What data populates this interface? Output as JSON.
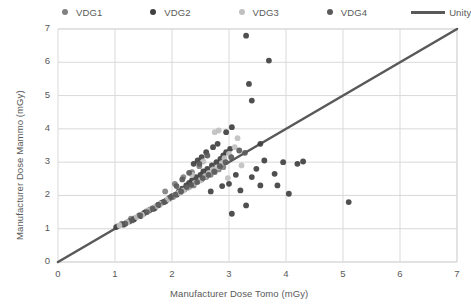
{
  "chart_data": {
    "type": "scatter",
    "title": "",
    "xlabel": "Manufacturer Dose Tomo (mGy)",
    "ylabel": "Manufacturer Dose Mammo (mGy)",
    "xlim": [
      0,
      7
    ],
    "ylim": [
      0,
      7
    ],
    "xticks": [
      0,
      1,
      2,
      3,
      4,
      5,
      6,
      7
    ],
    "yticks": [
      0,
      1,
      2,
      3,
      4,
      5,
      6,
      7
    ],
    "grid": true,
    "legend_position": "top",
    "colors": {
      "VDG1": "#808080",
      "VDG2": "#404040",
      "VDG3": "#c0c0c0",
      "VDG4": "#5a5a5a",
      "Unity": "#595959",
      "grid": "#d9d9d9",
      "axis": "#d9d9d9",
      "text": "#595959"
    },
    "series": [
      {
        "name": "VDG1",
        "color": "#808080",
        "points": [
          [
            1.05,
            1.08
          ],
          [
            1.12,
            1.15
          ],
          [
            1.2,
            1.18
          ],
          [
            1.28,
            1.3
          ],
          [
            1.35,
            1.32
          ],
          [
            1.42,
            1.4
          ],
          [
            1.5,
            1.45
          ],
          [
            1.55,
            1.52
          ],
          [
            1.62,
            1.58
          ],
          [
            1.7,
            1.62
          ],
          [
            1.78,
            1.72
          ],
          [
            1.85,
            1.8
          ],
          [
            1.9,
            1.85
          ],
          [
            1.95,
            1.9
          ],
          [
            2.02,
            1.95
          ],
          [
            2.1,
            2.05
          ],
          [
            2.15,
            2.1
          ],
          [
            2.22,
            2.18
          ],
          [
            2.3,
            2.25
          ],
          [
            2.38,
            2.3
          ],
          [
            2.45,
            2.42
          ],
          [
            2.52,
            2.48
          ],
          [
            2.6,
            2.55
          ],
          [
            2.68,
            2.62
          ],
          [
            2.75,
            2.7
          ],
          [
            2.82,
            2.78
          ],
          [
            2.9,
            2.85
          ],
          [
            2.2,
            2.55
          ],
          [
            2.35,
            2.7
          ],
          [
            2.48,
            2.88
          ],
          [
            2.05,
            2.35
          ],
          [
            1.88,
            2.12
          ]
        ]
      },
      {
        "name": "VDG2",
        "color": "#404040",
        "points": [
          [
            1.02,
            1.05
          ],
          [
            1.15,
            1.12
          ],
          [
            1.25,
            1.22
          ],
          [
            1.33,
            1.28
          ],
          [
            1.45,
            1.38
          ],
          [
            1.52,
            1.48
          ],
          [
            1.6,
            1.55
          ],
          [
            1.68,
            1.6
          ],
          [
            1.75,
            1.7
          ],
          [
            1.82,
            1.78
          ],
          [
            1.88,
            1.82
          ],
          [
            1.95,
            1.92
          ],
          [
            2.0,
            1.98
          ],
          [
            2.08,
            2.02
          ],
          [
            2.12,
            2.12
          ],
          [
            2.18,
            2.2
          ],
          [
            2.25,
            2.3
          ],
          [
            2.3,
            2.38
          ],
          [
            2.35,
            2.45
          ],
          [
            2.42,
            2.55
          ],
          [
            2.5,
            2.62
          ],
          [
            2.55,
            2.72
          ],
          [
            2.62,
            2.8
          ],
          [
            2.7,
            2.9
          ],
          [
            2.78,
            3.0
          ],
          [
            2.85,
            3.1
          ],
          [
            2.9,
            3.2
          ],
          [
            2.95,
            3.3
          ],
          [
            3.02,
            3.4
          ],
          [
            2.6,
            3.3
          ],
          [
            2.72,
            3.45
          ],
          [
            2.8,
            3.55
          ],
          [
            2.52,
            3.15
          ],
          [
            2.45,
            3.05
          ],
          [
            2.38,
            2.95
          ],
          [
            3.3,
            6.8
          ],
          [
            3.7,
            6.05
          ],
          [
            3.35,
            5.35
          ],
          [
            3.4,
            4.85
          ],
          [
            2.95,
            3.9
          ],
          [
            3.05,
            4.05
          ],
          [
            3.55,
            3.55
          ],
          [
            3.62,
            3.05
          ],
          [
            3.2,
            2.15
          ],
          [
            3.55,
            2.3
          ],
          [
            3.8,
            2.65
          ],
          [
            3.85,
            2.3
          ],
          [
            4.05,
            2.05
          ],
          [
            3.3,
            1.7
          ],
          [
            3.05,
            1.45
          ],
          [
            5.1,
            1.8
          ],
          [
            4.3,
            3.02
          ],
          [
            4.2,
            2.95
          ],
          [
            3.95,
            3.0
          ],
          [
            3.12,
            2.62
          ],
          [
            3.4,
            2.55
          ],
          [
            2.88,
            2.28
          ],
          [
            3.0,
            2.35
          ],
          [
            2.68,
            2.12
          ],
          [
            3.48,
            2.8
          ]
        ]
      },
      {
        "name": "VDG3",
        "color": "#c0c0c0",
        "points": [
          [
            1.08,
            1.1
          ],
          [
            1.22,
            1.2
          ],
          [
            1.38,
            1.35
          ],
          [
            1.48,
            1.42
          ],
          [
            1.58,
            1.55
          ],
          [
            1.65,
            1.62
          ],
          [
            1.72,
            1.68
          ],
          [
            1.8,
            1.75
          ],
          [
            1.92,
            1.88
          ],
          [
            2.05,
            2.0
          ],
          [
            2.12,
            2.08
          ],
          [
            2.2,
            2.15
          ],
          [
            2.28,
            2.22
          ],
          [
            2.4,
            2.38
          ],
          [
            2.5,
            2.45
          ],
          [
            2.58,
            2.58
          ],
          [
            2.65,
            2.68
          ],
          [
            2.72,
            2.78
          ],
          [
            2.8,
            2.85
          ],
          [
            2.88,
            2.98
          ],
          [
            2.92,
            3.12
          ],
          [
            3.0,
            3.25
          ],
          [
            3.1,
            3.45
          ],
          [
            2.75,
            3.9
          ],
          [
            2.82,
            3.95
          ],
          [
            3.15,
            3.72
          ],
          [
            2.55,
            3.02
          ],
          [
            2.35,
            2.62
          ],
          [
            3.22,
            2.9
          ],
          [
            2.98,
            2.52
          ]
        ]
      },
      {
        "name": "VDG4",
        "color": "#5a5a5a",
        "points": [
          [
            1.18,
            1.15
          ],
          [
            1.3,
            1.25
          ],
          [
            1.44,
            1.4
          ],
          [
            1.56,
            1.5
          ],
          [
            1.66,
            1.6
          ],
          [
            1.76,
            1.72
          ],
          [
            1.86,
            1.8
          ],
          [
            1.98,
            1.95
          ],
          [
            2.06,
            2.02
          ],
          [
            2.16,
            2.12
          ],
          [
            2.26,
            2.25
          ],
          [
            2.34,
            2.32
          ],
          [
            2.44,
            2.4
          ],
          [
            2.54,
            2.52
          ],
          [
            2.64,
            2.62
          ],
          [
            2.74,
            2.72
          ],
          [
            2.84,
            2.88
          ],
          [
            2.94,
            3.0
          ],
          [
            3.04,
            3.15
          ],
          [
            2.62,
            3.2
          ],
          [
            2.48,
            2.95
          ],
          [
            2.3,
            2.68
          ],
          [
            3.18,
            3.35
          ],
          [
            3.28,
            3.28
          ],
          [
            2.18,
            2.48
          ],
          [
            2.08,
            2.28
          ]
        ]
      }
    ],
    "reference_line": {
      "name": "Unity",
      "color": "#595959",
      "from": [
        0,
        0
      ],
      "to": [
        7,
        7
      ]
    }
  },
  "legend": {
    "items": [
      {
        "label": "VDG1",
        "kind": "dot",
        "color": "#808080"
      },
      {
        "label": "VDG2",
        "kind": "dot",
        "color": "#404040"
      },
      {
        "label": "VDG3",
        "kind": "dot",
        "color": "#c0c0c0"
      },
      {
        "label": "VDG4",
        "kind": "dot",
        "color": "#5a5a5a"
      },
      {
        "label": "Unity",
        "kind": "line",
        "color": "#595959"
      }
    ]
  }
}
